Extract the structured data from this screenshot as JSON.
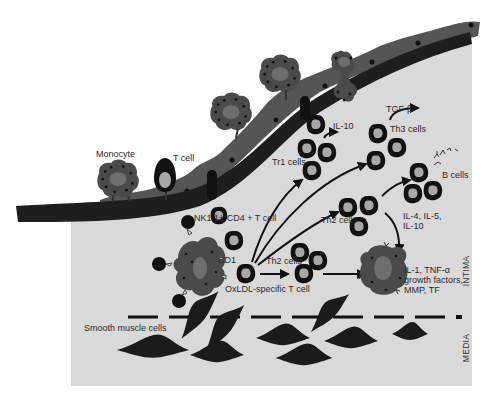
{
  "diagram": {
    "labels": {
      "monocyte": "Monocyte",
      "t_cell": "T cell",
      "il10_top": "IL-10",
      "tr1_cells": "Tr1 cells",
      "tgf_beta": "TGF-β",
      "th3_cells": "Th3 cells",
      "b_cells": "B cells",
      "nkt_cell": "NK1.1+ CD4 + T cell",
      "cd1": "CD1",
      "th2_cells_upper": "Th2 cells",
      "th2_cells_lower": "Th2 cells",
      "il4_line1": "IL-4, IL-5,",
      "il4_line2": "IL-10",
      "oxldl_t_cell": "OxLDL-specific T cell",
      "il1_line1": "IL-1, TNF-α",
      "il1_line2": "growth factors,",
      "il1_line3": "MMP, TF",
      "smooth_muscle": "Smooth muscle cells",
      "intima": "INTIMA",
      "media": "MEDIA"
    },
    "colors": {
      "background": "#ffffff",
      "intima_fill": "#d9d9d9",
      "wall": "#1e1e1e",
      "endothelium": "#555555",
      "cell_dark": "#4a4a4a",
      "cell_nucleus": "#6e6e6e",
      "lymph_ring": "#111111",
      "lymph_core": "#a8a8a8",
      "text": "#2a2a2a"
    }
  }
}
